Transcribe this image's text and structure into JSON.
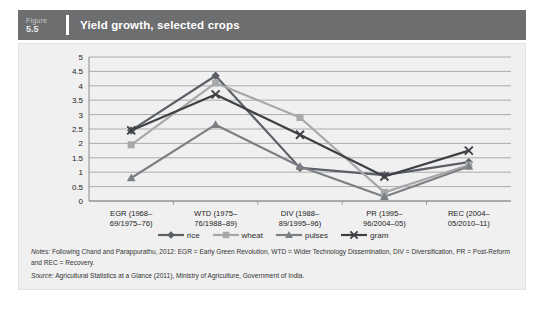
{
  "figure": {
    "label_word": "Figure",
    "number": "5.5",
    "title": "Yield growth, selected crops",
    "header_bg": "#6d6e70"
  },
  "chart_data": {
    "type": "line",
    "title": "Yield growth, selected crops",
    "xlabel": "",
    "ylabel": "",
    "ylim": [
      0,
      5
    ],
    "yticks": [
      "0",
      "0.5",
      "1",
      "1.5",
      "2",
      "2.5",
      "3",
      "3.5",
      "4",
      "4.5",
      "5"
    ],
    "grid": true,
    "legend_position": "bottom",
    "categories": [
      "EGR (1968–69/1975–76)",
      "WTD (1975–76/1988–89)",
      "DIV (1988–89/1995–96)",
      "PR (1995–96/2004–05)",
      "REC (2004–05/2010–11)"
    ],
    "category_lines": [
      [
        "EGR (1968–",
        "69/1975–76)"
      ],
      [
        "WTD (1975–",
        "76/1988–89)"
      ],
      [
        "DIV (1988–",
        "89/1995–96)"
      ],
      [
        "PR (1995–",
        "96/2004–05)"
      ],
      [
        "REC (2004–",
        "05/2010–11)"
      ]
    ],
    "series": [
      {
        "name": "rice",
        "color": "#5b5f66",
        "marker": "diamond",
        "values": [
          2.45,
          4.35,
          1.15,
          0.9,
          1.35
        ]
      },
      {
        "name": "wheat",
        "color": "#a6a8aa",
        "marker": "square",
        "values": [
          1.95,
          4.1,
          2.9,
          0.3,
          1.25
        ]
      },
      {
        "name": "pulses",
        "color": "#7c8085",
        "marker": "triangle",
        "values": [
          0.8,
          2.65,
          1.2,
          0.15,
          1.2
        ]
      },
      {
        "name": "gram",
        "color": "#3d4044",
        "marker": "cross",
        "values": [
          2.45,
          3.7,
          2.3,
          0.85,
          1.75
        ]
      }
    ]
  },
  "notes": {
    "lead": "Notes:",
    "text": " Following Chand and Parappurathu, 2012: EGR = Early Green Revolution, WTD = Wider Technology Dissemination, DIV = Diversification, PR = Post-Reform and REC = Recovery."
  },
  "source": {
    "lead": "Source:",
    "text": " Agricultural Statistics at a Glance (2011), Ministry of Agriculture, Government of India."
  }
}
